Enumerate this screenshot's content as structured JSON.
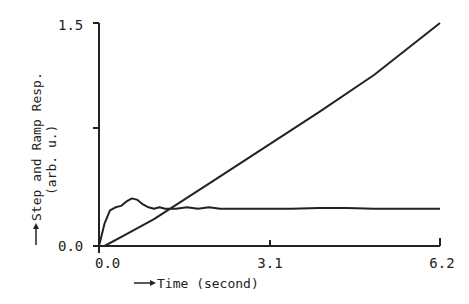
{
  "chart_data": {
    "type": "line",
    "title": "",
    "xlabel": "Time (second)",
    "ylabel": "Step and Ramp Resp.",
    "ylabel_sub": "(arb. u.)",
    "xlim": [
      0.0,
      6.2
    ],
    "ylim": [
      0.0,
      1.5
    ],
    "x_ticks": [
      "0.0",
      "3.1",
      "6.2"
    ],
    "y_ticks": [
      "0.0",
      "1.5"
    ],
    "grid": false,
    "legend": "none",
    "series": [
      {
        "name": "Step response",
        "x": [
          0.0,
          0.1,
          0.2,
          0.3,
          0.4,
          0.5,
          0.6,
          0.7,
          0.8,
          0.9,
          1.0,
          1.1,
          1.2,
          1.4,
          1.6,
          1.8,
          2.0,
          2.2,
          2.5,
          3.0,
          3.5,
          4.0,
          4.5,
          5.0,
          5.5,
          6.2
        ],
        "values": [
          0.0,
          0.15,
          0.24,
          0.26,
          0.27,
          0.3,
          0.32,
          0.31,
          0.28,
          0.26,
          0.25,
          0.26,
          0.25,
          0.25,
          0.26,
          0.25,
          0.26,
          0.25,
          0.25,
          0.25,
          0.25,
          0.255,
          0.255,
          0.25,
          0.25,
          0.25
        ]
      },
      {
        "name": "Ramp response",
        "x": [
          0.1,
          0.5,
          1.0,
          2.0,
          3.0,
          4.0,
          5.0,
          6.2
        ],
        "values": [
          0.0,
          0.08,
          0.18,
          0.42,
          0.66,
          0.9,
          1.15,
          1.5
        ]
      }
    ]
  },
  "labels": {
    "x_axis": "Time (second)",
    "y_axis_line1": "Step and Ramp Resp.",
    "y_axis_line2": "(arb. u.)",
    "x_tick_0": "0.0",
    "x_tick_1": "3.1",
    "x_tick_2": "6.2",
    "y_tick_0": "0.0",
    "y_tick_1": "1.5"
  }
}
